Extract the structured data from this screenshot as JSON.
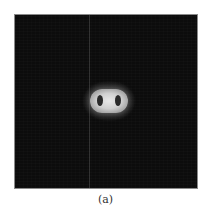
{
  "figure": {
    "caption": "(a)",
    "panel": {
      "description": "Dark grayscale image with a bright double-lobed blob at the center",
      "background_color": "#0c0c0c",
      "blob_color": "#e0e0e0"
    }
  }
}
